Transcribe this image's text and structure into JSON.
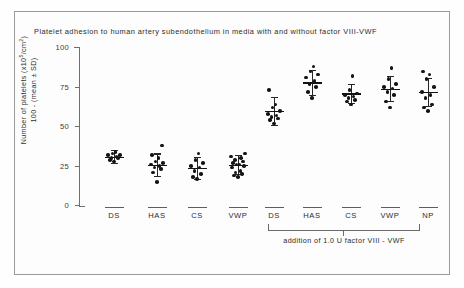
{
  "figure": {
    "title": "Platelet adhesion to human artery  subendothelium in media  with and without  factor VIII-VWF",
    "annotation": "addition  of 1.0  U factor  VIII - VWF",
    "ylabel_line1": "Number of platelets (x10⁵/cm²)",
    "ylabel_line2": "100 - (mean ± SD)"
  },
  "chart_data": {
    "type": "scatter",
    "title": "Platelet adhesion to human artery  subendothelium in media  with and without  factor VIII-VWF",
    "xlabel": "",
    "ylabel": "Number of platelets (x10⁵/cm²) 100 - (mean ± SD)",
    "ylim": [
      0,
      100
    ],
    "yticks": [
      0,
      25,
      50,
      75,
      100
    ],
    "ytick_labels": [
      "0",
      "25",
      "50",
      "75",
      "100"
    ],
    "grid": false,
    "legend": "none",
    "annotation": "addition  of 1.0  U factor  VIII - VWF",
    "annotation_spans_groups": [
      "DS",
      "HAS",
      "CS",
      "VWP"
    ],
    "panels": [
      {
        "name": "without factor VIII-VWF",
        "groups": [
          {
            "label": "DS",
            "mean": 31,
            "sd": 4,
            "points": [
              28,
              29,
              30,
              30,
              31,
              32,
              32,
              33,
              34
            ]
          },
          {
            "label": "HAS",
            "mean": 26,
            "sd": 7,
            "points": [
              15,
              21,
              23,
              24,
              25,
              26,
              27,
              28,
              30,
              32,
              38
            ]
          },
          {
            "label": "CS",
            "mean": 24,
            "sd": 7,
            "points": [
              17,
              18,
              20,
              22,
              24,
              25,
              27,
              29,
              33
            ]
          },
          {
            "label": "VWP",
            "mean": 26,
            "sd": 6,
            "points": [
              18,
              19,
              20,
              21,
              22,
              24,
              25,
              26,
              26,
              27,
              28,
              29,
              30,
              31,
              33
            ]
          }
        ]
      },
      {
        "name": "with addition of 1.0 U factor VIII-VWF",
        "groups": [
          {
            "label": "DS",
            "mean": 60,
            "sd": 9,
            "points": [
              52,
              54,
              55,
              56,
              57,
              58,
              60,
              62,
              64,
              73
            ]
          },
          {
            "label": "HAS",
            "mean": 78,
            "sd": 8,
            "points": [
              68,
              72,
              75,
              77,
              79,
              81,
              83,
              85,
              88
            ]
          },
          {
            "label": "CS",
            "mean": 71,
            "sd": 6,
            "points": [
              64,
              66,
              67,
              68,
              69,
              70,
              71,
              73,
              82
            ]
          },
          {
            "label": "VWP",
            "mean": 74,
            "sd": 8,
            "points": [
              62,
              66,
              70,
              72,
              74,
              75,
              77,
              80,
              87
            ]
          },
          {
            "label": "NP",
            "mean": 72,
            "sd": 9,
            "points": [
              60,
              62,
              64,
              68,
              70,
              72,
              75,
              80,
              83,
              85
            ]
          }
        ]
      }
    ]
  },
  "axis": {
    "ytick_labels": [
      "100",
      "75",
      "50",
      "25",
      "0"
    ]
  },
  "xaxis": {
    "labels": [
      "DS",
      "HAS",
      "CS",
      "VWP",
      "DS",
      "HAS",
      "CS",
      "VWP",
      "NP"
    ]
  }
}
